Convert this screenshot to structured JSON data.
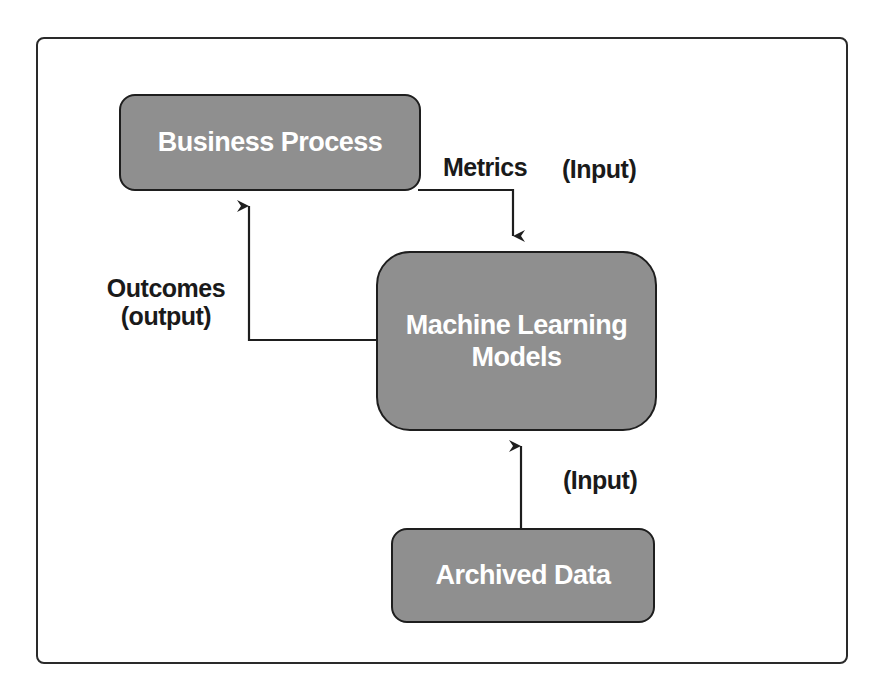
{
  "diagram": {
    "colors": {
      "node_fill": "#8f8f8f",
      "node_border": "#1e1e1e",
      "node_text": "#ffffff",
      "label_text": "#1a1a1a",
      "connector": "#1e1e1e",
      "frame": "#2a2a2a"
    },
    "nodes": {
      "business_process": {
        "label": "Business Process"
      },
      "ml_models": {
        "line1": "Machine Learning",
        "line2": "Models"
      },
      "archived_data": {
        "label": "Archived Data"
      }
    },
    "edge_labels": {
      "metrics": "Metrics",
      "metrics_input": "(Input)",
      "outcomes_line1": "Outcomes",
      "outcomes_line2": "(output)",
      "archived_input": "(Input)"
    },
    "edges": [
      {
        "from": "business_process",
        "to": "ml_models",
        "label": "Metrics (Input)"
      },
      {
        "from": "ml_models",
        "to": "business_process",
        "label": "Outcomes (output)"
      },
      {
        "from": "archived_data",
        "to": "ml_models",
        "label": "(Input)"
      }
    ]
  }
}
